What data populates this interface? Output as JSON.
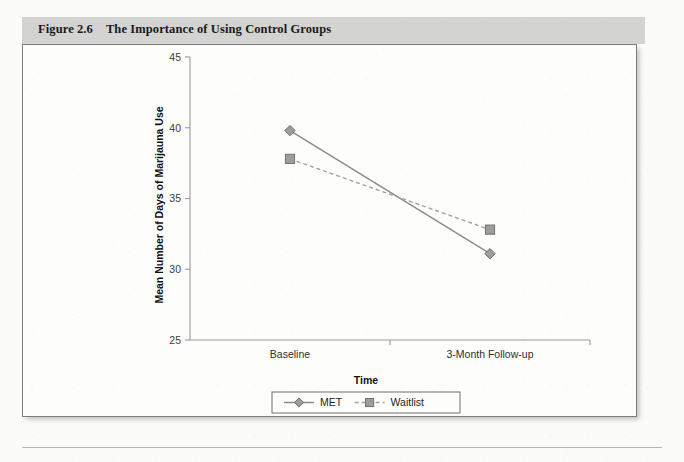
{
  "figure": {
    "number": "Figure 2.6",
    "title": "The Importance of Using Control Groups"
  },
  "chart_data": {
    "type": "line",
    "title": "The Importance of Using Control Groups",
    "xlabel": "Time",
    "ylabel": "Mean Number of Days of Marijauna Use",
    "categories": [
      "Baseline",
      "3-Month Follow-up"
    ],
    "ylim": [
      25,
      45
    ],
    "yticks": [
      25,
      30,
      35,
      40,
      45
    ],
    "ytick_labels": [
      "25",
      "30",
      "35",
      "40",
      "45"
    ],
    "grid": false,
    "legend_position": "bottom",
    "series": [
      {
        "name": "MET",
        "values": [
          39.8,
          31.1
        ],
        "marker": "diamond",
        "linestyle": "solid",
        "color": "#9d9d9d"
      },
      {
        "name": "Waitlist",
        "values": [
          37.8,
          32.8
        ],
        "marker": "square",
        "linestyle": "dashed",
        "color": "#9d9d9d"
      }
    ]
  }
}
